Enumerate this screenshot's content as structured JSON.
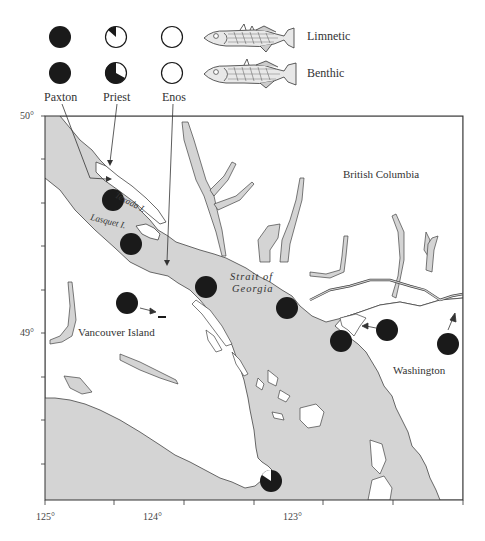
{
  "legend": {
    "populations": [
      {
        "name": "Paxton",
        "limnetic_fraction": 1.0,
        "benthic_fraction": 1.0
      },
      {
        "name": "Priest",
        "limnetic_fraction": 0.12,
        "benthic_fraction": 0.65
      },
      {
        "name": "Enos",
        "limnetic_fraction": 0.0,
        "benthic_fraction": 0.0
      }
    ],
    "forms": [
      {
        "label": "Limnetic",
        "icon": "stickleback-fish-icon"
      },
      {
        "label": "Benthic",
        "icon": "stickleback-fish-icon"
      }
    ]
  },
  "map": {
    "regions": {
      "british_columbia": "British Columbia",
      "vancouver_island": "Vancouver Island",
      "washington": "Washington",
      "strait_line1": "Strait of",
      "strait_line2": "Georgia",
      "texada": "Texada I.",
      "lasquet": "Lasquet I."
    },
    "lat_labels": [
      "50°",
      "49°"
    ],
    "lon_labels": [
      "125°",
      "124°",
      "123°"
    ],
    "colors": {
      "water": "#d4d4d4",
      "land": "#ffffff",
      "coast": "#444444",
      "marker": "#1a1a1a"
    },
    "sample_sites": [
      {
        "id": "site-1",
        "fill": 1.0
      },
      {
        "id": "site-2",
        "fill": 1.0
      },
      {
        "id": "site-3",
        "fill": 0.95
      },
      {
        "id": "site-4",
        "fill": 1.0
      },
      {
        "id": "site-5",
        "fill": 1.0
      },
      {
        "id": "site-6",
        "fill": 1.0
      },
      {
        "id": "site-7",
        "fill": 1.0
      },
      {
        "id": "site-8",
        "fill": 1.0
      },
      {
        "id": "site-9",
        "fill": 0.88
      }
    ]
  }
}
